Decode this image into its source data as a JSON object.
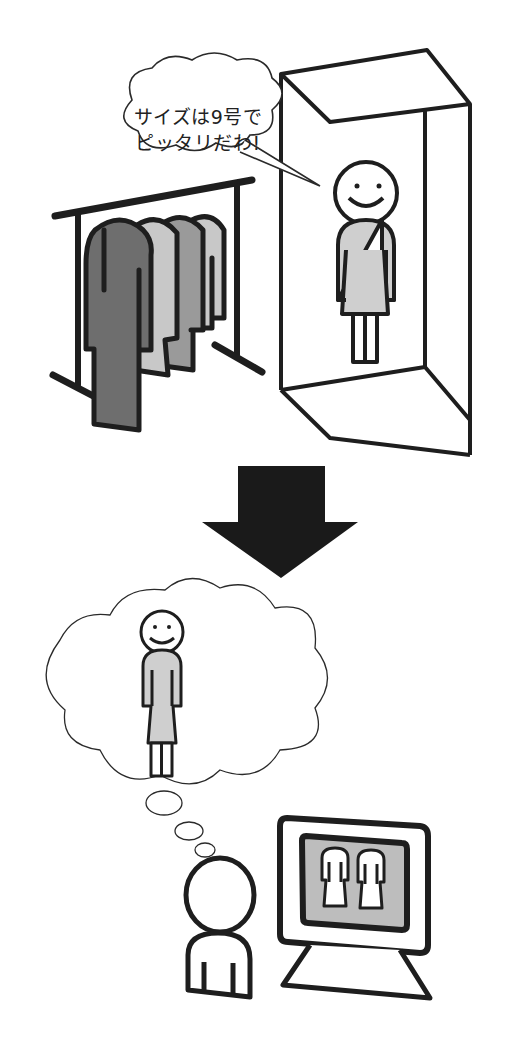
{
  "speech_bubble": {
    "line1": "サイズは9号で",
    "line2": "ピッタリだわ!"
  },
  "colors": {
    "outline": "#1e1e1e",
    "garment_dark": "#6e6e6e",
    "garment_light": "#c8c8c8",
    "garment_mid": "#9a9a9a",
    "dress_fill": "#cfcfcf",
    "screen_fill": "#bdbdbd",
    "arrow": "#1a1a1a"
  },
  "scenes": [
    {
      "id": "fitting-room",
      "description": "Woman trying on dress in fitting room next to clothes rack"
    },
    {
      "id": "online-shopping",
      "description": "Person imagining the fit while viewing dresses on a computer monitor"
    }
  ]
}
